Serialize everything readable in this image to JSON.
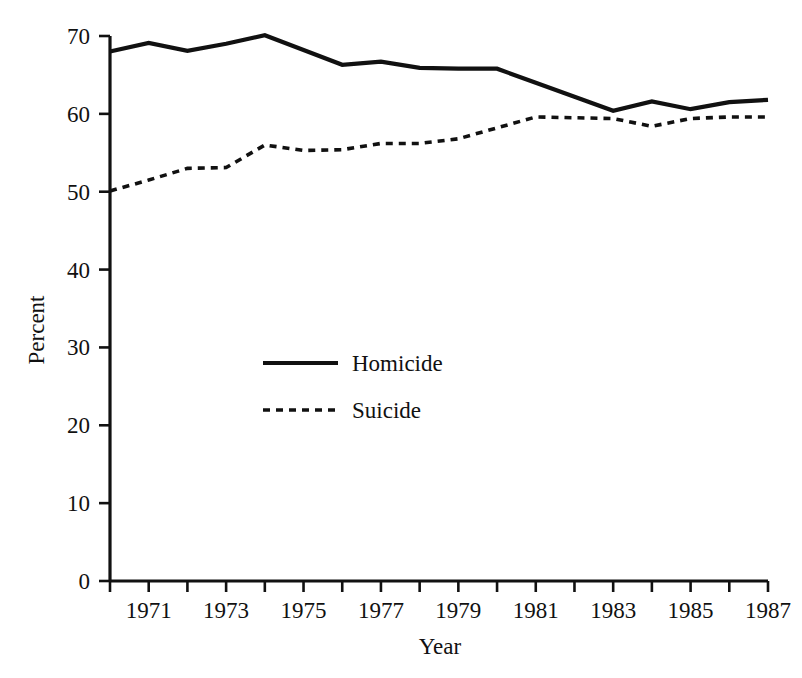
{
  "chart_data": {
    "type": "line",
    "title": "",
    "xlabel": "Year",
    "ylabel": "Percent",
    "grid": false,
    "legend_position": "center-left-inside",
    "xlim": [
      1970,
      1987
    ],
    "ylim": [
      0,
      70
    ],
    "y_ticks": [
      0,
      10,
      20,
      30,
      40,
      50,
      60,
      70
    ],
    "y_tick_labels": [
      "0",
      "10",
      "20",
      "30",
      "40",
      "50",
      "60",
      "70"
    ],
    "x": [
      1970,
      1971,
      1972,
      1973,
      1974,
      1975,
      1976,
      1977,
      1978,
      1979,
      1980,
      1981,
      1982,
      1983,
      1984,
      1985,
      1986,
      1987
    ],
    "x_ticks": [
      1970,
      1971,
      1972,
      1973,
      1974,
      1975,
      1976,
      1977,
      1978,
      1979,
      1980,
      1981,
      1982,
      1983,
      1984,
      1985,
      1986,
      1987
    ],
    "x_tick_labels": [
      "",
      "1971",
      "",
      "1973",
      "",
      "1975",
      "",
      "1977",
      "",
      "1979",
      "",
      "1981",
      "",
      "1983",
      "",
      "1985",
      "",
      "1987"
    ],
    "series": [
      {
        "name": "Homicide",
        "style": "solid",
        "color": "#111111",
        "values": [
          68.0,
          69.1,
          68.1,
          69.0,
          70.1,
          68.2,
          66.3,
          66.7,
          65.9,
          65.8,
          65.8,
          64.0,
          62.2,
          60.4,
          61.6,
          60.6,
          61.5,
          61.8
        ]
      },
      {
        "name": "Suicide",
        "style": "dotted",
        "color": "#111111",
        "values": [
          50.1,
          51.5,
          53.0,
          53.1,
          56.0,
          55.3,
          55.4,
          56.2,
          56.2,
          56.8,
          58.2,
          59.6,
          59.5,
          59.4,
          58.4,
          59.4,
          59.6,
          59.6
        ]
      }
    ],
    "legend_entries": [
      {
        "label": "Homicide",
        "style": "solid"
      },
      {
        "label": "Suicide",
        "style": "dotted"
      }
    ]
  },
  "axis": {
    "y_title": "Percent",
    "x_title": "Year"
  }
}
